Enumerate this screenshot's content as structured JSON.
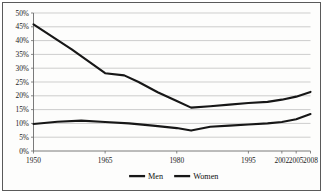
{
  "chart_data": {
    "type": "line",
    "title": "",
    "subtitle": "",
    "xlabel": "",
    "ylabel": "",
    "grid": true,
    "legend_position": "bottom",
    "xlim": [
      1950,
      2008
    ],
    "ylim": [
      0,
      50
    ],
    "y_tick_labels": [
      "50%",
      "45%",
      "40%",
      "35%",
      "30%",
      "25%",
      "20%",
      "15%",
      "10%",
      "5%",
      "0%"
    ],
    "y_tick_values": [
      50,
      45,
      40,
      35,
      30,
      25,
      20,
      15,
      10,
      5,
      0
    ],
    "x_tick_labels": [
      "1950",
      "1965",
      "1980",
      "1995",
      "2002",
      "2005",
      "2008"
    ],
    "x_tick_values": [
      1950,
      1965,
      1980,
      1995,
      2002,
      2005,
      2008
    ],
    "series": [
      {
        "name": "Men",
        "color": "#171717",
        "x": [
          1950,
          1958,
          1965,
          1969,
          1972,
          1976,
          1980,
          1983,
          1987,
          1991,
          1995,
          1999,
          2002,
          2005,
          2008
        ],
        "values": [
          45.9,
          36.8,
          28.2,
          27.4,
          25.0,
          21.3,
          18.1,
          15.7,
          16.2,
          16.8,
          17.4,
          17.8,
          18.6,
          19.7,
          21.4
        ]
      },
      {
        "name": "Women",
        "color": "#171717",
        "x": [
          1950,
          1955,
          1960,
          1965,
          1970,
          1975,
          1980,
          1983,
          1987,
          1991,
          1995,
          1999,
          2002,
          2005,
          2008
        ],
        "values": [
          9.8,
          10.6,
          11.0,
          10.5,
          10.0,
          9.2,
          8.3,
          7.4,
          8.8,
          9.2,
          9.6,
          10.0,
          10.5,
          11.5,
          13.4
        ]
      }
    ]
  },
  "legend": {
    "items": [
      {
        "label": "Men"
      },
      {
        "label": "Women"
      }
    ]
  },
  "axes": {
    "y_labels": [
      "50%",
      "45%",
      "40%",
      "35%",
      "30%",
      "25%",
      "20%",
      "15%",
      "10%",
      "5%",
      "0%"
    ],
    "x_labels": [
      "1950",
      "1965",
      "1980",
      "1995",
      "2002",
      "2005",
      "2008"
    ]
  }
}
